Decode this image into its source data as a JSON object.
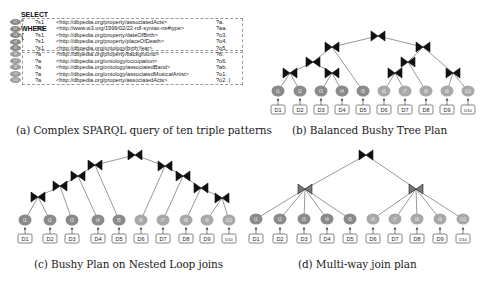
{
  "panel_a": {
    "select_line": "SELECT * WHERE {",
    "triples": [
      {
        "id": "t1",
        "subject": "?s1",
        "predicate": "<http://dbpedia.org/property/associatedActs>",
        "object": "?a."
      },
      {
        "id": "t2",
        "subject": "?s1",
        "predicate": "<http://www.w3.org/1999/02/22-rdf-syntax-ns#type>",
        "object": "?aa."
      },
      {
        "id": "t3",
        "subject": "?s1",
        "predicate": "<http://dbpedia.org/property/dateOfBirth>",
        "object": "?o3."
      },
      {
        "id": "t4",
        "subject": "?s1",
        "predicate": "<http://dbpedia.org/property/placeOfDeath>",
        "object": "?o4."
      },
      {
        "id": "t5",
        "subject": "?s1",
        "predicate": "<http://dbpedia.org/ontology/birthYear>",
        "object": "?o5."
      },
      {
        "id": "t6",
        "subject": "?a",
        "predicate": "<http://dbpedia.org/property/background>",
        "object": "?b."
      },
      {
        "id": "t7",
        "subject": "?a",
        "predicate": "<http://dbpedia.org/ontology/occupation>",
        "object": "?o6."
      },
      {
        "id": "t8",
        "subject": "?a",
        "predicate": "<http://dbpedia.org/ontology/associatedBand>",
        "object": "?ab."
      },
      {
        "id": "t9",
        "subject": "?a",
        "predicate": "<http://dbpedia.org/ontology/associatedMusicalArtist>",
        "object": "?o1."
      },
      {
        "id": "t10",
        "subject": "?a",
        "predicate": "<http://dbpedia.org/property/associatedActs>",
        "object": "?o2 .}"
      }
    ],
    "caption": "(a) Complex SPARQL query of ten triple patterns"
  },
  "panel_b": {
    "caption": "(b) Balanced Bushy Tree Plan",
    "leaves": [
      "t1",
      "t2",
      "t3",
      "t4",
      "t5",
      "t6",
      "t7",
      "t8",
      "t9",
      "t10"
    ],
    "datasets": [
      "D1",
      "D2",
      "D3",
      "D4",
      "D5",
      "D6",
      "D7",
      "D8",
      "D9",
      "D10"
    ]
  },
  "panel_c": {
    "caption": "(c) Bushy Plan on Nested Loop joins",
    "leaves": [
      "t1",
      "t2",
      "t3",
      "t4",
      "t5",
      "t6",
      "t7",
      "t8",
      "t9",
      "t10"
    ],
    "datasets": [
      "D1",
      "D2",
      "D3",
      "D4",
      "D5",
      "D6",
      "D7",
      "D8",
      "D9",
      "D10"
    ]
  },
  "panel_d": {
    "caption": "(d) Multi-way join plan",
    "leaves": [
      "t1",
      "t2",
      "t3",
      "t4",
      "t5",
      "t6",
      "t7",
      "t8",
      "t9",
      "t10"
    ],
    "datasets": [
      "D1",
      "D2",
      "D3",
      "D4",
      "D5",
      "D6",
      "D7",
      "D8",
      "D9",
      "D10"
    ]
  },
  "colors": {
    "node_dark": "#8a8a8a",
    "node_light": "#a8a8a8",
    "join_icon": "#111111",
    "multiway_join_icon": "#777777",
    "edge": "#555555",
    "dashed_border": "#9a9a9a"
  }
}
